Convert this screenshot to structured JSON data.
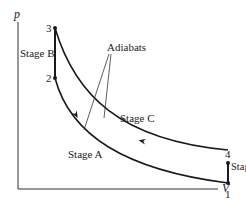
{
  "diagram": {
    "type": "pV cycle diagram",
    "axes": {
      "y_label": "p",
      "x_label": "V"
    },
    "points": [
      {
        "id": "1",
        "label": "1"
      },
      {
        "id": "2",
        "label": "2"
      },
      {
        "id": "3",
        "label": "3"
      },
      {
        "id": "4",
        "label": "4"
      }
    ],
    "stages": {
      "A": "Stage A",
      "B": "Stage B",
      "C": "Stage C",
      "D": "Stage D"
    },
    "annotation": "Adiabats",
    "colors": {
      "line": "#1a1a1a",
      "background": "#ffffff"
    }
  }
}
